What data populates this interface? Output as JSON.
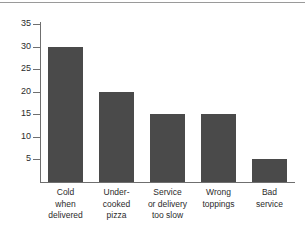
{
  "chart_data": {
    "type": "bar",
    "title": "",
    "subtitle": "",
    "xlabel": "",
    "ylabel": "",
    "categories": [
      "Cold when delivered",
      "Under-cooked pizza",
      "Service or delivery too slow",
      "Wrong toppings",
      "Bad service"
    ],
    "category_lines": [
      [
        "Cold",
        "when",
        "delivered"
      ],
      [
        "Under-",
        "cooked",
        "pizza"
      ],
      [
        "Service",
        "or delivery",
        "too slow"
      ],
      [
        "Wrong",
        "toppings"
      ],
      [
        "Bad",
        "service"
      ]
    ],
    "values": [
      30,
      20,
      15,
      15,
      5
    ],
    "ylim": [
      0,
      35
    ],
    "ytick_labels": [
      "35",
      "30",
      "25",
      "20",
      "15",
      "10",
      "5"
    ],
    "ytick_values": [
      35,
      30,
      25,
      20,
      15,
      10,
      5
    ],
    "grid": false,
    "legend": false,
    "legend_position": "none",
    "bar_color": "#4a4a4a",
    "axis_color": "#6f6f6f",
    "background_color": "#ffffff",
    "rule_color": "#9a9a9a"
  }
}
